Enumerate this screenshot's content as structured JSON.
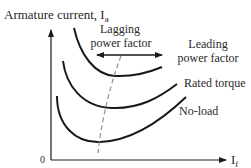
{
  "diagram": {
    "y_axis": {
      "label": "Armature current, I",
      "label_subscript": "a"
    },
    "x_axis": {
      "label": "I",
      "label_subscript": "f"
    },
    "origin_label": "0",
    "annotations": {
      "lagging_line1": "Lagging",
      "lagging_line2": "power factor",
      "leading_line1": "Leading",
      "leading_line2": "power factor"
    },
    "curves": [
      {
        "name": "top-curve",
        "label": ""
      },
      {
        "name": "rated-torque-curve",
        "label": "Rated torque"
      },
      {
        "name": "no-load-curve",
        "label": "No-load"
      }
    ],
    "colors": {
      "line": "#1a1a1a",
      "dashed": "#888888",
      "text": "#2a2a2a"
    }
  }
}
